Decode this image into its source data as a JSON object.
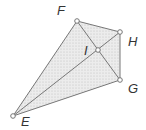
{
  "diagram": {
    "type": "geometry-figure",
    "points": {
      "E": {
        "label": "E",
        "x": 13,
        "y": 116,
        "lx": 21,
        "ly": 126
      },
      "F": {
        "label": "F",
        "x": 77,
        "y": 21,
        "lx": 57,
        "ly": 15
      },
      "H": {
        "label": "H",
        "x": 120,
        "y": 32,
        "lx": 128,
        "ly": 46
      },
      "I": {
        "label": "I",
        "x": 98,
        "y": 50,
        "lx": 84,
        "ly": 55
      },
      "G": {
        "label": "G",
        "x": 120,
        "y": 80,
        "lx": 128,
        "ly": 93
      }
    },
    "segments": [
      [
        "E",
        "F"
      ],
      [
        "F",
        "H"
      ],
      [
        "H",
        "G"
      ],
      [
        "G",
        "E"
      ],
      [
        "E",
        "H"
      ],
      [
        "F",
        "G"
      ]
    ],
    "shaded_region": [
      "E",
      "F",
      "H",
      "G"
    ],
    "colors": {
      "line": "#777777",
      "fill": "#e4e4e4",
      "stipple": "#b8b8b8",
      "point_fill": "#ffffff",
      "label": "#333333"
    }
  }
}
